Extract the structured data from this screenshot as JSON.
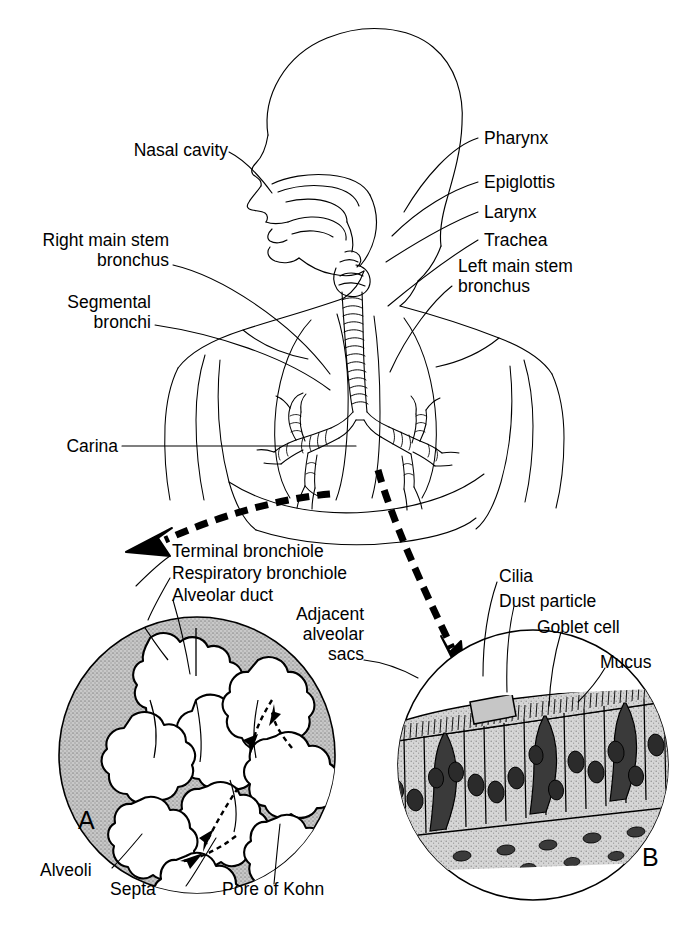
{
  "figure": {
    "background_color": "#ffffff",
    "line_color": "#000000",
    "shade_color": "#b8b8b8"
  },
  "labels": {
    "nasal_cavity": "Nasal cavity",
    "right_main_stem_bronchus": "Right main stem\nbronchus",
    "segmental_bronchi": "Segmental\nbronchi",
    "carina": "Carina",
    "pharynx": "Pharynx",
    "epiglottis": "Epiglottis",
    "larynx": "Larynx",
    "trachea": "Trachea",
    "left_main_stem_bronchus": "Left main stem\nbronchus",
    "terminal_bronchiole": "Terminal bronchiole",
    "respiratory_bronchiole": "Respiratory bronchiole",
    "alveolar_duct": "Alveolar duct",
    "adjacent_alveolar_sacs": "Adjacent\nalveolar\nsacs",
    "cilia": "Cilia",
    "dust_particle": "Dust particle",
    "goblet_cell": "Goblet cell",
    "mucus": "Mucus",
    "alveoli": "Alveoli",
    "septa": "Septa",
    "pore_of_kohn": "Pore of Kohn",
    "panel_a": "A",
    "panel_b": "B"
  }
}
